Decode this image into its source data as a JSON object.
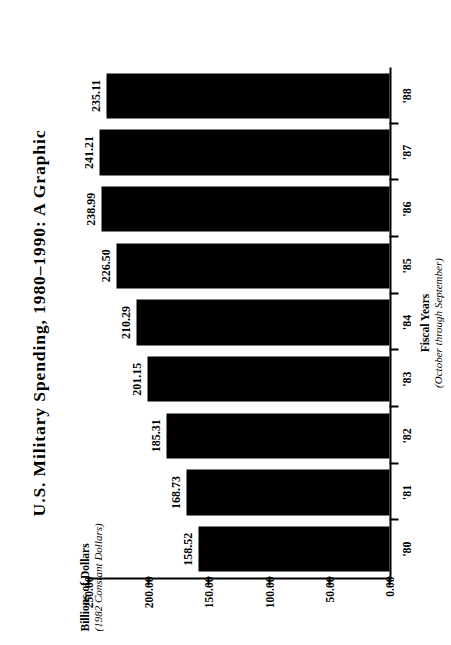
{
  "chart_data": {
    "type": "bar",
    "orientation": "vertical-rotated",
    "title": "U.S. Military Spending, 1980–1990:  A Graphic",
    "categories": [
      "'80",
      "'81",
      "'82",
      "'83",
      "'84",
      "'85",
      "'86",
      "'87",
      "'88"
    ],
    "values": [
      158.52,
      168.73,
      185.31,
      201.15,
      210.29,
      226.5,
      238.99,
      241.21,
      235.11
    ],
    "value_labels": [
      "158.52",
      "168.73",
      "185.31",
      "201.15",
      "210.29",
      "226.50",
      "238.99",
      "241.21",
      "235.11"
    ],
    "series": [
      {
        "name": "U.S. Military Spending",
        "values": [
          158.52,
          168.73,
          185.31,
          201.15,
          210.29,
          226.5,
          238.99,
          241.21,
          235.11
        ]
      }
    ],
    "ylabel": "Billions of Dollars",
    "ylabel_sub": "(1982 Constant Dollars)",
    "xlabel": "Fiscal Years",
    "xlabel_sub": "(October through September)",
    "ylim": [
      0.0,
      250.0
    ],
    "yticks": [
      250.0,
      200.0,
      150.0,
      100.0,
      50.0,
      0.0
    ],
    "ytick_labels": [
      "250.00",
      "200.00",
      "150.00",
      "100.00",
      "50.00",
      "0.00"
    ],
    "grid": false,
    "legend": false,
    "bar_color": "#000000",
    "background_color": "#ffffff",
    "rotation_degrees": -90
  },
  "axes": {
    "value_axis": {
      "title": "Billions of Dollars",
      "subtitle": "(1982 Constant Dollars)",
      "ticks": [
        "250.00",
        "200.00",
        "150.00",
        "100.00",
        "50.00",
        "0.00"
      ]
    },
    "category_axis": {
      "title": "Fiscal Years",
      "subtitle": "(October through September)",
      "ticks": [
        "'80",
        "'81",
        "'82",
        "'83",
        "'84",
        "'85",
        "'86",
        "'87",
        "'88"
      ]
    }
  },
  "page": {
    "title": "U.S. Military Spending, 1980–1990:  A Graphic"
  }
}
